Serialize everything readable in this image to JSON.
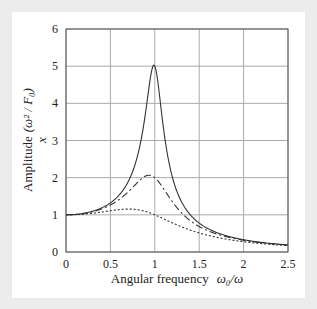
{
  "chart_data": {
    "type": "line",
    "title": "",
    "xlabel": "Angular frequency  ω₀/ω",
    "ylabel": "Amplitude (ω² / F₀) x",
    "xlim": [
      0,
      2.5
    ],
    "ylim": [
      0,
      6
    ],
    "xticks": [
      "0",
      "0.5",
      "1",
      "1.5",
      "2",
      "2.5"
    ],
    "yticks": [
      "0",
      "1",
      "2",
      "3",
      "4",
      "5",
      "6"
    ],
    "grid": true,
    "legend": null,
    "series": [
      {
        "name": "solid (high resonance)",
        "style": "solid",
        "x": [
          0,
          0.25,
          0.5,
          0.75,
          0.9,
          0.95,
          1.0,
          1.05,
          1.1,
          1.25,
          1.5,
          2.0,
          2.5
        ],
        "y": [
          1.0,
          1.07,
          1.32,
          2.15,
          3.7,
          4.5,
          5.0,
          4.3,
          3.3,
          1.6,
          0.79,
          0.33,
          0.19
        ]
      },
      {
        "name": "dash-dot (medium damping)",
        "style": "dashdot",
        "x": [
          0,
          0.25,
          0.5,
          0.75,
          0.9,
          0.95,
          1.0,
          1.1,
          1.25,
          1.5,
          2.0,
          2.5
        ],
        "y": [
          1.0,
          1.06,
          1.28,
          1.8,
          2.06,
          2.08,
          2.0,
          1.65,
          1.2,
          0.72,
          0.32,
          0.19
        ]
      },
      {
        "name": "dotted (heavy damping)",
        "style": "dotted",
        "x": [
          0,
          0.25,
          0.5,
          0.7,
          0.85,
          1.0,
          1.25,
          1.5,
          2.0,
          2.5
        ],
        "y": [
          1.0,
          1.04,
          1.11,
          1.15,
          1.11,
          1.0,
          0.78,
          0.58,
          0.3,
          0.18
        ]
      }
    ]
  },
  "axes": {
    "xlabel_text": "Angular frequency",
    "xlabel_math": "ω₀/ω",
    "ylabel_text": "Amplitude",
    "ylabel_math": "(ω² / F₀)",
    "ylabel_var": "x"
  }
}
